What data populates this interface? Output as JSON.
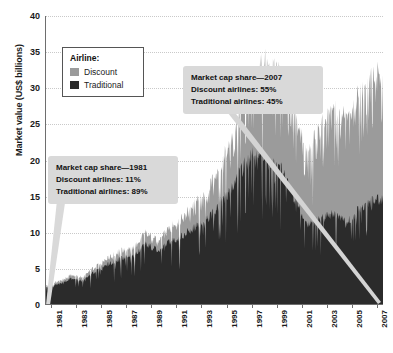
{
  "chart_data": {
    "type": "area",
    "subtype": "stacked-area",
    "title": "",
    "xlabel": "",
    "ylabel": "Market value (US$ billions)",
    "xlim": [
      1981,
      2008
    ],
    "ylim": [
      0,
      40
    ],
    "yticks": [
      0,
      5,
      10,
      15,
      20,
      25,
      30,
      35,
      40
    ],
    "xticks": [
      1981,
      1983,
      1985,
      1987,
      1989,
      1991,
      1993,
      1995,
      1997,
      1999,
      2001,
      2003,
      2005,
      2007
    ],
    "grid": true,
    "grid_style": "dotted-horizontal",
    "legend_position": "upper-left-inside",
    "legend_title": "Airline:",
    "series": [
      {
        "name": "Traditional",
        "color": "#2b2b2b",
        "stack_order": 1,
        "values_by_year": [
          {
            "year": 1981,
            "value": 2.4
          },
          {
            "year": 1982,
            "value": 2.8
          },
          {
            "year": 1983,
            "value": 3.6
          },
          {
            "year": 1984,
            "value": 3.4
          },
          {
            "year": 1985,
            "value": 4.6
          },
          {
            "year": 1986,
            "value": 5.6
          },
          {
            "year": 1987,
            "value": 6.4
          },
          {
            "year": 1988,
            "value": 6.8
          },
          {
            "year": 1989,
            "value": 8.4
          },
          {
            "year": 1990,
            "value": 7.6
          },
          {
            "year": 1991,
            "value": 8.8
          },
          {
            "year": 1992,
            "value": 9.6
          },
          {
            "year": 1993,
            "value": 10.8
          },
          {
            "year": 1994,
            "value": 12.0
          },
          {
            "year": 1995,
            "value": 14.0
          },
          {
            "year": 1996,
            "value": 16.4
          },
          {
            "year": 1997,
            "value": 19.6
          },
          {
            "year": 1998,
            "value": 21.5
          },
          {
            "year": 1999,
            "value": 20.0
          },
          {
            "year": 2000,
            "value": 18.5
          },
          {
            "year": 2001,
            "value": 14.5
          },
          {
            "year": 2002,
            "value": 11.0
          },
          {
            "year": 2003,
            "value": 12.0
          },
          {
            "year": 2004,
            "value": 12.5
          },
          {
            "year": 2005,
            "value": 11.5
          },
          {
            "year": 2006,
            "value": 13.0
          },
          {
            "year": 2007,
            "value": 14.5
          }
        ]
      },
      {
        "name": "Discount",
        "color": "#9b9b9b",
        "stack_order": 2,
        "values_by_year": [
          {
            "year": 1981,
            "value": 0.3
          },
          {
            "year": 1982,
            "value": 0.4
          },
          {
            "year": 1983,
            "value": 0.5
          },
          {
            "year": 1984,
            "value": 0.5
          },
          {
            "year": 1985,
            "value": 0.7
          },
          {
            "year": 1986,
            "value": 0.9
          },
          {
            "year": 1987,
            "value": 1.1
          },
          {
            "year": 1988,
            "value": 1.2
          },
          {
            "year": 1989,
            "value": 1.6
          },
          {
            "year": 1990,
            "value": 1.5
          },
          {
            "year": 1991,
            "value": 2.0
          },
          {
            "year": 1992,
            "value": 2.6
          },
          {
            "year": 1993,
            "value": 3.4
          },
          {
            "year": 1994,
            "value": 4.2
          },
          {
            "year": 1995,
            "value": 5.4
          },
          {
            "year": 1996,
            "value": 7.0
          },
          {
            "year": 1997,
            "value": 9.4
          },
          {
            "year": 1998,
            "value": 12.0
          },
          {
            "year": 1999,
            "value": 14.5
          },
          {
            "year": 2000,
            "value": 13.5
          },
          {
            "year": 2001,
            "value": 12.0
          },
          {
            "year": 2002,
            "value": 10.5
          },
          {
            "year": 2003,
            "value": 13.0
          },
          {
            "year": 2004,
            "value": 14.5
          },
          {
            "year": 2005,
            "value": 15.0
          },
          {
            "year": 2006,
            "value": 16.0
          },
          {
            "year": 2007,
            "value": 17.5
          }
        ]
      }
    ],
    "annotations": [
      {
        "id": "1981",
        "lines": [
          "Market cap share—1981",
          "Discount airlines: 11%",
          "Traditional airlines: 89%"
        ],
        "points_to_year": 1981
      },
      {
        "id": "2007",
        "lines": [
          "Market cap share—2007",
          "Discount airlines: 55%",
          "Traditional airlines: 45%"
        ],
        "points_to_year": 2007
      }
    ]
  },
  "legend": {
    "title": "Airline:",
    "items": [
      {
        "label": "Discount",
        "color": "#9b9b9b"
      },
      {
        "label": "Traditional",
        "color": "#2b2b2b"
      }
    ]
  },
  "axes": {
    "ylabel": "Market value (US$ billions)",
    "yticks": [
      "0",
      "5",
      "10",
      "15",
      "20",
      "25",
      "30",
      "35",
      "40"
    ],
    "xticks": [
      "1981",
      "1983",
      "1985",
      "1987",
      "1989",
      "1991",
      "1993",
      "1995",
      "1997",
      "1999",
      "2001",
      "2003",
      "2005",
      "2007"
    ]
  },
  "callouts": {
    "c1981": {
      "line1": "Market cap share—1981",
      "line2": "Discount airlines: 11%",
      "line3": "Traditional airlines: 89%"
    },
    "c2007": {
      "line1": "Market cap share—2007",
      "line2": "Discount airlines: 55%",
      "line3": "Traditional airlines: 45%"
    }
  },
  "colors": {
    "discount": "#9b9b9b",
    "traditional": "#2b2b2b",
    "callout_bg": "#d9d9d9",
    "grid": "#c9c9c9",
    "axis": "#6e6e6e"
  }
}
